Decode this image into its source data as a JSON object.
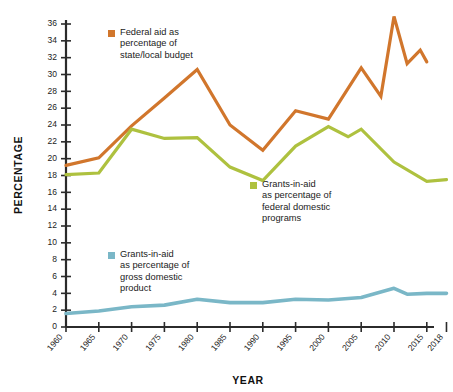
{
  "chart_data": {
    "type": "line",
    "title": "",
    "xlabel": "YEAR",
    "ylabel": "PERCENTAGE",
    "grid": false,
    "legend_position": "inline-annotations",
    "xlim": [
      1960,
      2018
    ],
    "ylim": [
      0,
      36
    ],
    "y_ticks": [
      0,
      2,
      4,
      6,
      8,
      10,
      12,
      14,
      16,
      18,
      20,
      22,
      24,
      26,
      28,
      30,
      32,
      34,
      36
    ],
    "x_ticks": [
      "1960",
      "1965",
      "1970",
      "1975",
      "1980",
      "1985",
      "1990",
      "1995",
      "2000",
      "2005",
      "2010",
      "2015",
      "2018"
    ],
    "x": [
      1960,
      1965,
      1970,
      1975,
      1980,
      1985,
      1990,
      1995,
      2000,
      2005,
      2010,
      2015,
      2018
    ],
    "series": [
      {
        "name": "Federal aid as percentage of state/local budget",
        "color": "#d1762c",
        "x": [
          1960,
          1965,
          1970,
          1975,
          1980,
          1985,
          1990,
          1995,
          2000,
          2005,
          2008,
          2010,
          2012,
          2014,
          2015
        ],
        "values": [
          19.2,
          20.1,
          23.9,
          27.2,
          30.6,
          24.0,
          21.0,
          25.7,
          24.7,
          30.8,
          27.4,
          36.9,
          31.3,
          32.9,
          31.5
        ]
      },
      {
        "name": "Grants-in-aid as percentage of federal domestic programs",
        "color": "#aec13f",
        "x": [
          1960,
          1965,
          1970,
          1975,
          1980,
          1985,
          1990,
          1995,
          2000,
          2003,
          2005,
          2010,
          2015,
          2018
        ],
        "values": [
          18.1,
          18.3,
          23.5,
          22.4,
          22.5,
          19.0,
          17.4,
          21.5,
          23.8,
          22.6,
          23.5,
          19.6,
          17.3,
          17.5
        ]
      },
      {
        "name": "Grants-in-aid as percentage of gross domestic product",
        "color": "#7ab7c7",
        "x": [
          1960,
          1965,
          1970,
          1975,
          1980,
          1985,
          1990,
          1995,
          2000,
          2005,
          2010,
          2012,
          2015,
          2018
        ],
        "values": [
          1.6,
          1.9,
          2.4,
          2.6,
          3.3,
          2.9,
          2.9,
          3.3,
          3.2,
          3.5,
          4.6,
          3.9,
          4.0,
          4.0
        ]
      }
    ]
  },
  "axes": {
    "y_title": "PERCENTAGE",
    "x_title": "YEAR",
    "y_tick_labels": [
      "0",
      "2",
      "4",
      "6",
      "8",
      "10",
      "12",
      "14",
      "16",
      "18",
      "20",
      "22",
      "24",
      "26",
      "28",
      "30",
      "32",
      "34",
      "36"
    ],
    "x_tick_labels": [
      "1960",
      "1965",
      "1970",
      "1975",
      "1980",
      "1985",
      "1990",
      "1995",
      "2000",
      "2005",
      "2010",
      "2015",
      "2018"
    ]
  },
  "legends": [
    {
      "key": "federal_aid",
      "color": "#d1762c",
      "lines": [
        "Federal aid as",
        "percentage of",
        "state/local budget"
      ]
    },
    {
      "key": "federal_domestic",
      "color": "#aec13f",
      "lines": [
        "Grants-in-aid",
        "as percentage of",
        "federal domestic",
        "programs"
      ]
    },
    {
      "key": "gdp",
      "color": "#7ab7c7",
      "lines": [
        "Grants-in-aid",
        "as percentage of",
        "gross domestic",
        "product"
      ]
    }
  ],
  "colors": {
    "orange": "#d1762c",
    "green": "#aec13f",
    "blue": "#7ab7c7",
    "axis": "#2b2b2b",
    "text": "#1b1b1b",
    "background": "#ffffff"
  }
}
